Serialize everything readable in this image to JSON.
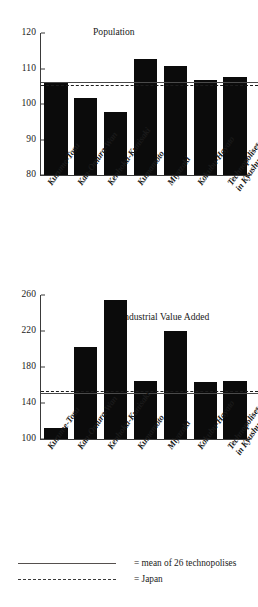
{
  "chart_data": [
    {
      "type": "bar",
      "title": "Population",
      "xlabel": "",
      "ylabel": "",
      "ylim": [
        80,
        120
      ],
      "yticks": [
        80,
        90,
        100,
        110,
        120
      ],
      "grid": false,
      "categories": [
        "Kurume-Tosu",
        "Kan-Omura-Wan",
        "Kenhoku-Kunisaki",
        "Kumamoto",
        "Miyazaki",
        "Kokubu-Hayato",
        "Technopolises in Kyushu"
      ],
      "values": [
        106.0,
        101.8,
        97.8,
        112.6,
        110.7,
        106.8,
        107.7
      ],
      "reference_lines": [
        {
          "label": "mean of 26 technopolises",
          "value": 106.0,
          "style": "solid"
        },
        {
          "label": "Japan",
          "value": 105.0,
          "style": "dashed"
        }
      ]
    },
    {
      "type": "bar",
      "title": "Industrial Value Added",
      "xlabel": "",
      "ylabel": "",
      "ylim": [
        100,
        260
      ],
      "yticks": [
        100,
        140,
        180,
        220,
        260
      ],
      "grid": false,
      "categories": [
        "Kurume-Tosu",
        "Kan-Omura-Wan",
        "Kenhoku-Kunisaki",
        "Kumamoto",
        "Miyazaki",
        "Kokubu-Hayato",
        "Technopolises in Kyushu"
      ],
      "values": [
        112.0,
        202.0,
        255.0,
        165.0,
        220.5,
        163.0,
        165.0
      ],
      "reference_lines": [
        {
          "label": "mean of 26 technopolises",
          "value": 150.0,
          "style": "solid"
        },
        {
          "label": "Japan",
          "value": 152.5,
          "style": "dashed"
        }
      ]
    }
  ],
  "charts": {
    "top": {
      "title": "Population",
      "yticks": [
        "120",
        "110",
        "100",
        "90",
        "80"
      ],
      "categories": [
        {
          "line1": "Kurume-Tosu",
          "line2": ""
        },
        {
          "line1": "Kan-Omura-Wan",
          "line2": ""
        },
        {
          "line1": "Kenhoku-Kunisaki",
          "line2": ""
        },
        {
          "line1": "Kumamoto",
          "line2": ""
        },
        {
          "line1": "Miyazaki",
          "line2": ""
        },
        {
          "line1": "Kokubu-Hayato",
          "line2": ""
        },
        {
          "line1": "Technopolises",
          "line2": "in Kyushu"
        }
      ]
    },
    "bottom": {
      "title": "Industrial Value Added",
      "yticks": [
        "260",
        "220",
        "180",
        "140",
        "100"
      ],
      "categories": [
        {
          "line1": "Kurume-Tosu",
          "line2": ""
        },
        {
          "line1": "Kan-Omura-Wan",
          "line2": ""
        },
        {
          "line1": "Kenhoku-Kunisaki",
          "line2": ""
        },
        {
          "line1": "Kumamoto",
          "line2": ""
        },
        {
          "line1": "Miyazaki",
          "line2": ""
        },
        {
          "line1": "Kokubu-Hayato",
          "line2": ""
        },
        {
          "line1": "Technopolises",
          "line2": "in Kyushu"
        }
      ]
    }
  },
  "legend": {
    "mean_label": "= mean of 26 technopolises",
    "japan_label": "= Japan"
  },
  "colors": {
    "bar": "#0b0b0b",
    "axis": "#3a3a3a",
    "mean_line": "#55504e",
    "japan_line": "#1c1c1c",
    "background": "#ffffff",
    "text": "#1a1a1a"
  }
}
